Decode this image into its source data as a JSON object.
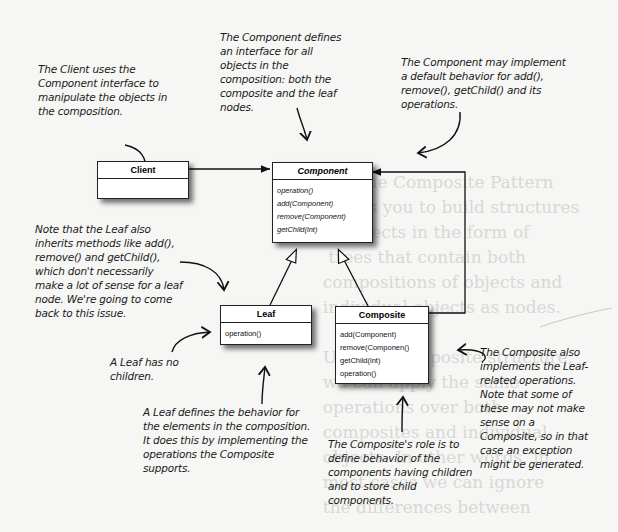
{
  "background_text": "        The Composite Pattern\n  allows you to build structures\n  of objects in the form of\n   trees that contain both\n  compositions of objects and\n  individual objects as nodes.\n\n  Using a composite structure,\n  we can apply the same\n  operations over both\n  composites and individual\n  objects. In other words, in\n  most cases we can ignore\n  the differences between",
  "classes": {
    "client": {
      "name": "Client",
      "operations": []
    },
    "component": {
      "name": "Component",
      "abstract": true,
      "operations": [
        "operation()",
        "add(Component)",
        "remove(Component)",
        "getChild(int)"
      ]
    },
    "leaf": {
      "name": "Leaf",
      "operations": [
        "operation()"
      ]
    },
    "composite": {
      "name": "Composite",
      "operations": [
        "add(Component)",
        "remove(Componen()",
        "getChild(int)",
        "operation()"
      ]
    }
  },
  "relationships": [
    {
      "from": "Client",
      "to": "Component",
      "type": "association"
    },
    {
      "from": "Leaf",
      "to": "Component",
      "type": "inheritance"
    },
    {
      "from": "Composite",
      "to": "Component",
      "type": "inheritance"
    },
    {
      "from": "Composite",
      "to": "Component",
      "type": "aggregation"
    }
  ],
  "annotations": {
    "client_note": "The Client uses the Component interface to manipulate the objects in the composition.",
    "component_note": "The Component defines an interface for all objects in the composition: both the composite and the leaf nodes.",
    "default_behavior_note": "The Component may implement a default behavior for add(), remove(), getChild() and its operations.",
    "leaf_inherits_note": "Note that the Leaf also inherits methods like add(), remove() and getChild(), which don't necessarily make a lot of sense for a leaf node. We're going to come back to this issue.",
    "leaf_children_note": "A Leaf has no children.",
    "leaf_behavior_note": "A Leaf defines the behavior for the elements in the composition. It does this by implementing the operations the Composite supports.",
    "composite_role_note": "The Composite's role is to define behavior of the components having children and to store child components.",
    "composite_leaf_ops_note": "The Composite also implements the Leaf-related operations. Note that some of these may not make sense on a Composite, so in that case an exception might be generated."
  }
}
